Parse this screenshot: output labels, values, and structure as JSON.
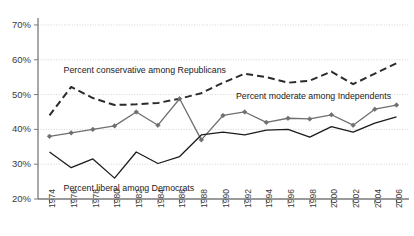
{
  "chart_data": {
    "type": "line",
    "title": "",
    "subtitle": "",
    "xlabel": "",
    "ylabel": "",
    "categories": [
      1974,
      1976,
      1978,
      1980,
      1982,
      1984,
      1986,
      1988,
      1990,
      1992,
      1994,
      1996,
      1998,
      2000,
      2002,
      2004,
      2006
    ],
    "xtick_labels": [
      "1974",
      "1976",
      "1978",
      "1980",
      "1982",
      "1984",
      "1986",
      "1988",
      "1990",
      "1992",
      "1994",
      "1996",
      "1998",
      "2000",
      "2002",
      "2004",
      "2006"
    ],
    "ytick_labels": [
      "20%",
      "30%",
      "40%",
      "50%",
      "60%",
      "70%"
    ],
    "ytick_values": [
      20,
      30,
      40,
      50,
      60,
      70
    ],
    "ylim": [
      20,
      72
    ],
    "xlim": [
      1973,
      2007
    ],
    "grid": true,
    "grid_axis": "y",
    "legend": "inline-annotations",
    "series": [
      {
        "name": "Percent conservative among Republicans",
        "style": "dashed",
        "marker": "none",
        "color": "#2b2b2b",
        "annotation": "Percent conservative among Republicans",
        "values": [
          44.0,
          52.2,
          49.0,
          47.0,
          47.2,
          47.6,
          48.8,
          50.4,
          53.4,
          56.0,
          55.0,
          53.4,
          54.0,
          56.6,
          53.0,
          56.0,
          59.0
        ]
      },
      {
        "name": "Percent moderate among Independents",
        "style": "solid",
        "marker": "diamond",
        "color": "#6f6f6f",
        "annotation": "Percent moderate among Independents",
        "values": [
          38.0,
          39.0,
          40.0,
          41.0,
          45.0,
          41.2,
          48.8,
          37.0,
          44.0,
          45.0,
          42.0,
          43.2,
          43.0,
          44.2,
          41.2,
          45.8,
          47.0
        ]
      },
      {
        "name": "Percent liberal among Democrats",
        "style": "solid",
        "marker": "none",
        "color": "#1c1c1c",
        "annotation": "Percent liberal among Democrats",
        "values": [
          33.5,
          29.0,
          31.5,
          26.0,
          33.5,
          30.2,
          32.2,
          38.4,
          39.2,
          38.4,
          39.8,
          40.0,
          37.8,
          40.8,
          39.2,
          41.8,
          43.6
        ]
      }
    ],
    "annotations": [
      {
        "text": "Percent conservative among Republicans",
        "x": 1975.3,
        "y": 57.0
      },
      {
        "text": "Percent moderate among Independents",
        "x": 1991.2,
        "y": 49.4
      },
      {
        "text": "Percent liberal among Democrats",
        "x": 1975.3,
        "y": 23.0
      }
    ]
  },
  "republicans_dash_y": [
    44.0,
    52.2,
    49.0,
    47.0,
    47.2,
    47.6,
    48.8,
    50.4,
    53.4,
    56.0,
    55.0,
    53.4,
    54.0,
    56.6,
    53.0,
    56.0,
    59.0
  ]
}
